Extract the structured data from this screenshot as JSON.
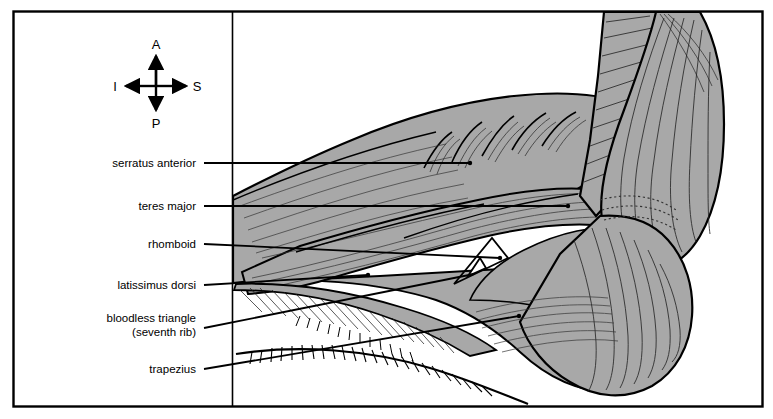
{
  "figure": {
    "frame": {
      "stroke": "#000000",
      "fill": "#ffffff"
    },
    "muscle_fill": "#a8a8a8",
    "muscle_stroke": "#000000",
    "highlight_fill": "#ffffff"
  },
  "orientation": {
    "name": "orientation-compass",
    "anterior": "A",
    "posterior": "P",
    "superior": "S",
    "inferior": "I"
  },
  "labels": [
    {
      "id": "serratus-anterior",
      "text": "serratus anterior",
      "line2": ""
    },
    {
      "id": "teres-major",
      "text": "teres major",
      "line2": ""
    },
    {
      "id": "rhomboid",
      "text": "rhomboid",
      "line2": ""
    },
    {
      "id": "latissimus-dorsi",
      "text": "latissimus dorsi",
      "line2": ""
    },
    {
      "id": "bloodless-triangle",
      "text": "bloodless triangle",
      "line2": "(seventh rib)"
    },
    {
      "id": "trapezius",
      "text": "trapezius",
      "line2": ""
    }
  ]
}
